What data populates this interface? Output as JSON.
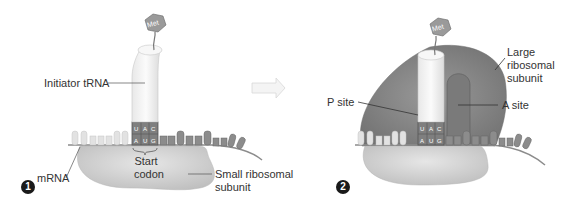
{
  "panel1": {
    "step": "1",
    "amino_acid": "Met",
    "anticodon": [
      "U",
      "A",
      "C"
    ],
    "codon": [
      "A",
      "U",
      "G"
    ],
    "labels": {
      "trna": "Initiator tRNA",
      "mrna": "mRNA",
      "start_codon": "Start codon",
      "small_subunit": "Small ribosomal subunit"
    }
  },
  "panel2": {
    "step": "2",
    "amino_acid": "Met",
    "anticodon": [
      "U",
      "A",
      "C"
    ],
    "codon": [
      "A",
      "U",
      "G"
    ],
    "labels": {
      "large_subunit": "Large ribosomal subunit",
      "p_site": "P site",
      "a_site": "A site"
    }
  },
  "colors": {
    "ribosome_small": "#d6d6d6",
    "ribosome_large": "#8a8a8a",
    "trna": "#f2f2f2",
    "mrna_dark": "#8c8c8c",
    "mrna_light": "#e2e2e2",
    "met": "#9a9a9a"
  }
}
